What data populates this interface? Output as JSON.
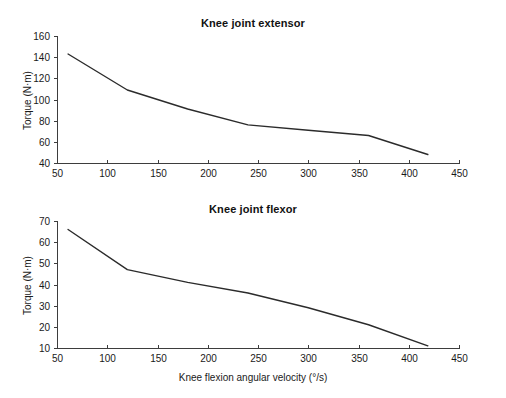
{
  "figure": {
    "background_color": "#ffffff",
    "line_color": "#2b2b2b",
    "axis_color": "#3d3d3d",
    "shared_xlabel": "Knee flexion angular velocity (°/s)"
  },
  "chart_data": [
    {
      "type": "line",
      "title": "Knee joint extensor",
      "xlabel": "",
      "ylabel": "Torque (N·m)",
      "xlim": [
        50,
        450
      ],
      "ylim": [
        40,
        160
      ],
      "xticks": [
        50,
        100,
        150,
        200,
        250,
        300,
        350,
        400,
        450
      ],
      "xticklabels": [
        "50",
        "100",
        "150",
        "200",
        "250",
        "300",
        "350",
        "400",
        "450"
      ],
      "yticks": [
        40,
        60,
        80,
        100,
        120,
        140,
        160
      ],
      "yticklabels": [
        "40",
        "60",
        "80",
        "100",
        "120",
        "140",
        "160"
      ],
      "grid": false,
      "legend": false,
      "series": [
        {
          "name": "Knee joint extensor torque",
          "x": [
            61,
            120,
            180,
            240,
            300,
            360,
            419
          ],
          "y": [
            143,
            109,
            91,
            76,
            71,
            66,
            48
          ]
        }
      ]
    },
    {
      "type": "line",
      "title": "Knee joint flexor",
      "xlabel": "Knee flexion angular velocity (°/s)",
      "ylabel": "Torque (N·m)",
      "xlim": [
        50,
        450
      ],
      "ylim": [
        10,
        70
      ],
      "xticks": [
        50,
        100,
        150,
        200,
        250,
        300,
        350,
        400,
        450
      ],
      "xticklabels": [
        "50",
        "100",
        "150",
        "200",
        "250",
        "300",
        "350",
        "400",
        "450"
      ],
      "yticks": [
        10,
        20,
        30,
        40,
        50,
        60,
        70
      ],
      "yticklabels": [
        "10",
        "20",
        "30",
        "40",
        "50",
        "60",
        "70"
      ],
      "grid": false,
      "legend": false,
      "series": [
        {
          "name": "Knee joint flexor torque",
          "x": [
            61,
            120,
            180,
            240,
            300,
            360,
            419
          ],
          "y": [
            66,
            47,
            41,
            36,
            29,
            21,
            11
          ]
        }
      ]
    }
  ]
}
